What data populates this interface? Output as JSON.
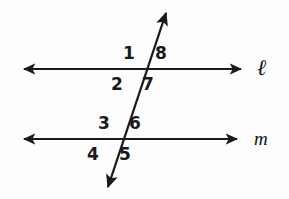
{
  "figure": {
    "background_color": "#fdfdfd",
    "stroke_color": "#1a1a1a"
  },
  "lines": {
    "parallel_upper": {
      "label": "ℓ",
      "name": "line-l",
      "y": 69,
      "x_start": 18,
      "x_end": 247,
      "arrow_both_ends": true
    },
    "parallel_lower": {
      "label": "m",
      "name": "line-m",
      "y": 139,
      "x_start": 18,
      "x_end": 243,
      "arrow_both_ends": true
    },
    "transversal": {
      "name": "transversal",
      "x_top": 170,
      "y_top": 6,
      "x_bottom": 104,
      "y_bottom": 194,
      "arrow_both_ends": true
    }
  },
  "intersections": [
    {
      "name": "upper-intersection",
      "x": 150,
      "y": 69
    },
    {
      "name": "lower-intersection",
      "x": 126,
      "y": 139
    }
  ],
  "angle_labels": [
    {
      "id": "1",
      "text": "1",
      "x": 129,
      "y": 45,
      "position": "upper-left-of-upper-intersection"
    },
    {
      "id": "8",
      "text": "8",
      "x": 161,
      "y": 45,
      "position": "upper-right-of-upper-intersection"
    },
    {
      "id": "2",
      "text": "2",
      "x": 117,
      "y": 76,
      "position": "lower-left-of-upper-intersection"
    },
    {
      "id": "7",
      "text": "7",
      "x": 148,
      "y": 76,
      "position": "lower-right-of-upper-intersection"
    },
    {
      "id": "3",
      "text": "3",
      "x": 104,
      "y": 115,
      "position": "upper-left-of-lower-intersection"
    },
    {
      "id": "6",
      "text": "6",
      "x": 135,
      "y": 115,
      "position": "upper-right-of-lower-intersection"
    },
    {
      "id": "4",
      "text": "4",
      "x": 93,
      "y": 146,
      "position": "lower-left-of-lower-intersection"
    },
    {
      "id": "5",
      "text": "5",
      "x": 125,
      "y": 146,
      "position": "lower-right-of-lower-intersection"
    }
  ],
  "line_labels": [
    {
      "id": "l",
      "text": "ℓ",
      "x": 258,
      "y": 58
    },
    {
      "id": "m",
      "text": "m",
      "x": 255,
      "y": 129
    }
  ]
}
